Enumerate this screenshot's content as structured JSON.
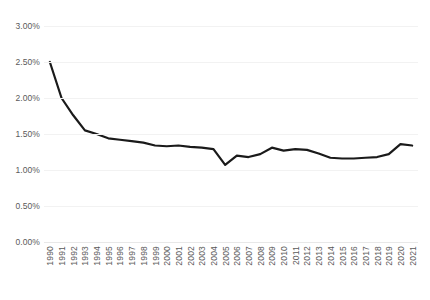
{
  "chart_data": {
    "type": "line",
    "title": "",
    "subtitle": "",
    "xlabel": "",
    "ylabel": "",
    "grid": true,
    "legend_position": "none",
    "ylim": [
      0.0,
      3.0
    ],
    "ytick_labels": [
      "3.00%",
      "2.50%",
      "2.00%",
      "1.50%",
      "1.00%",
      "0.50%",
      "0.00%"
    ],
    "ytick_values": [
      3.0,
      2.5,
      2.0,
      1.5,
      1.0,
      0.5,
      0.0
    ],
    "yaxis_unit": "%",
    "line_color": "#1a1a1a",
    "line_width": 2.2,
    "categories": [
      "1990",
      "1991",
      "1992",
      "1993",
      "1994",
      "1995",
      "1996",
      "1997",
      "1998",
      "1999",
      "2000",
      "2001",
      "2002",
      "2003",
      "2004",
      "2005",
      "2006",
      "2007",
      "2008",
      "2009",
      "2010",
      "2011",
      "2012",
      "2013",
      "2014",
      "2015",
      "2016",
      "2017",
      "2018",
      "2019",
      "2020",
      "2021"
    ],
    "x": [
      1990,
      1991,
      1992,
      1993,
      1994,
      1995,
      1996,
      1997,
      1998,
      1999,
      2000,
      2001,
      2002,
      2003,
      2004,
      2005,
      2006,
      2007,
      2008,
      2009,
      2010,
      2011,
      2012,
      2013,
      2014,
      2015,
      2016,
      2017,
      2018,
      2019,
      2020,
      2021
    ],
    "values": [
      2.5,
      2.0,
      1.76,
      1.55,
      1.5,
      1.44,
      1.42,
      1.4,
      1.38,
      1.34,
      1.33,
      1.34,
      1.32,
      1.31,
      1.29,
      1.07,
      1.2,
      1.18,
      1.22,
      1.31,
      1.27,
      1.29,
      1.28,
      1.23,
      1.17,
      1.16,
      1.16,
      1.17,
      1.18,
      1.22,
      1.36,
      1.34
    ],
    "series": [
      {
        "name": "rate",
        "values": [
          2.5,
          2.0,
          1.76,
          1.55,
          1.5,
          1.44,
          1.42,
          1.4,
          1.38,
          1.34,
          1.33,
          1.34,
          1.32,
          1.31,
          1.29,
          1.07,
          1.2,
          1.18,
          1.22,
          1.31,
          1.27,
          1.29,
          1.28,
          1.23,
          1.17,
          1.16,
          1.16,
          1.17,
          1.18,
          1.22,
          1.36,
          1.34
        ]
      }
    ]
  }
}
